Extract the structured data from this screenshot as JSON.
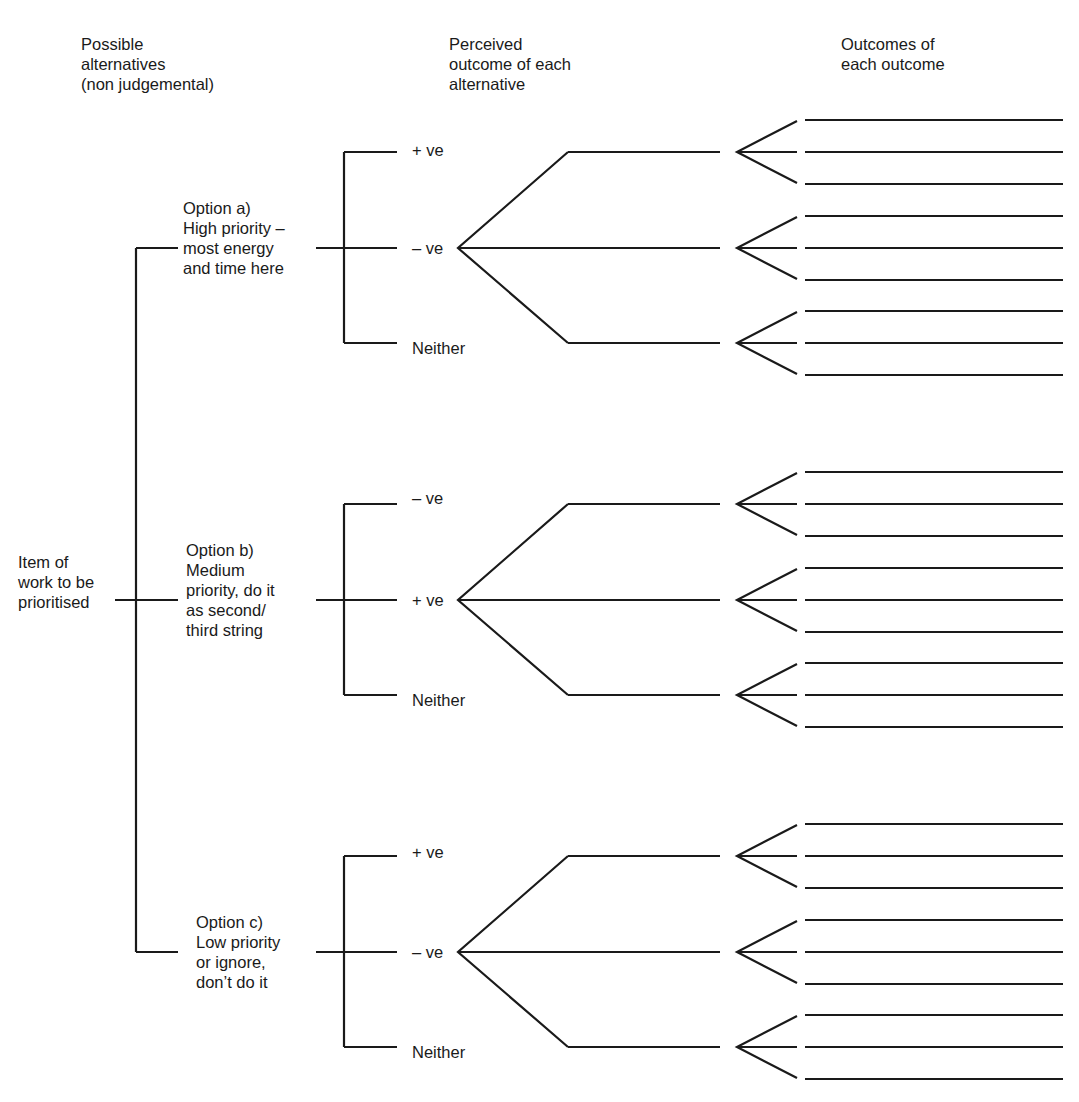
{
  "headers": {
    "alternatives": "Possible\nalternatives\n(non judgemental)",
    "perceived": "Perceived\noutcome of each\nalternative",
    "outcomes": "Outcomes of\neach outcome"
  },
  "root": {
    "label": "Item of\nwork to be\nprioritised"
  },
  "options": [
    {
      "label": "Option a)\nHigh priority –\nmost energy\nand time here",
      "outcomes": [
        "+ ve",
        "– ve",
        "Neither"
      ]
    },
    {
      "label": "Option b)\nMedium\npriority, do it\nas second/\nthird string",
      "outcomes": [
        "– ve",
        "+ ve",
        "Neither"
      ]
    },
    {
      "label": "Option c)\nLow priority\nor ignore,\ndon’t do it",
      "outcomes": [
        "+ ve",
        "– ve",
        "Neither"
      ]
    }
  ],
  "sub_outcomes_per_branch": 3
}
